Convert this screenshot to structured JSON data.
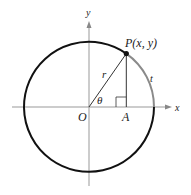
{
  "diagram": {
    "type": "unit-circle-trig-definition",
    "axes": {
      "x_label": "x",
      "y_label": "y"
    },
    "points": {
      "origin": "O",
      "point_on_circle": "P(x, y)",
      "foot": "A"
    },
    "labels": {
      "radius": "r",
      "angle": "θ",
      "arc": "t"
    },
    "colors": {
      "circle": "#111111",
      "arc_highlight": "#8a8a8a",
      "axes": "#888888",
      "segments": "#333333"
    }
  }
}
